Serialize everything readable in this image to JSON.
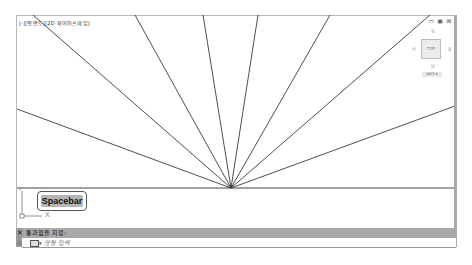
{
  "viewport": {
    "label": "[-][평면도][2D 와이어프레임]",
    "window_controls": {
      "restore": "▭",
      "maximize": "▣",
      "close": "⊠"
    }
  },
  "viewcube": {
    "north": "북",
    "west": "서",
    "east": "동",
    "south": "남",
    "face": "TOP",
    "wcs": "WCS ▾"
  },
  "drawing": {
    "center": [
      231,
      188
    ],
    "line_color": "#222222",
    "rays": [
      [
        17,
        109
      ],
      [
        33,
        15
      ],
      [
        135,
        15
      ],
      [
        203,
        15
      ],
      [
        258,
        15
      ],
      [
        330,
        15
      ],
      [
        430,
        15
      ],
      [
        455,
        106
      ]
    ],
    "baseline": {
      "x1": 17,
      "x2": 455,
      "y": 188
    }
  },
  "overlay": {
    "spacebar_label": "Spacebar"
  },
  "ucs": {
    "x_label": "X",
    "y_label": "Y"
  },
  "command_line": {
    "close_label": "✕",
    "prompt": "통과점을 지정:",
    "input_placeholder": "명령 입력",
    "dropdown_arrow": "▾",
    "customize_icon": "🔧"
  }
}
